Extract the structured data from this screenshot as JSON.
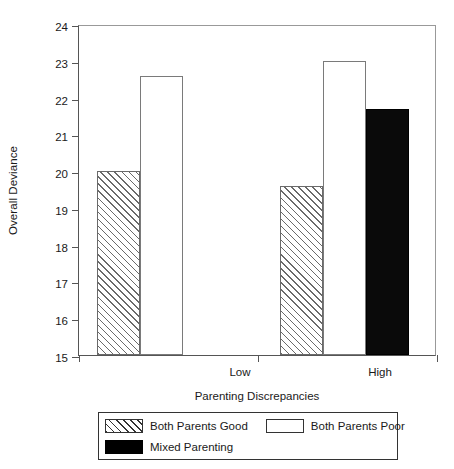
{
  "chart_data": {
    "type": "bar",
    "title": "",
    "subtitle": "",
    "xlabel": "Parenting Discrepancies",
    "ylabel": "Overall Deviance",
    "categories": [
      "Low",
      "High"
    ],
    "ylim": [
      15,
      24
    ],
    "yticks": [
      15,
      16,
      17,
      18,
      19,
      20,
      21,
      22,
      23,
      24
    ],
    "ytick_labels": [
      "15",
      "16",
      "17",
      "18",
      "19",
      "20",
      "21",
      "22",
      "23",
      "24"
    ],
    "grid": false,
    "legend_position": "bottom",
    "series": [
      {
        "name": "Both Parents Good",
        "fill": "hatch",
        "color": "#6a6a6a",
        "values": [
          20.0,
          19.6
        ]
      },
      {
        "name": "Both Parents Poor",
        "fill": "white",
        "color": "#ffffff",
        "values": [
          22.6,
          23.0
        ]
      },
      {
        "name": "Mixed Parenting",
        "fill": "black",
        "color": "#000000",
        "values": [
          null,
          21.7
        ]
      }
    ],
    "bars": [
      {
        "category": "Low",
        "series": "Both Parents Good",
        "value": 20.0,
        "fill": "hatch",
        "x": 96,
        "width": 43
      },
      {
        "category": "Low",
        "series": "Both Parents Poor",
        "value": 22.6,
        "fill": "white",
        "x": 139,
        "width": 43
      },
      {
        "category": "High",
        "series": "Both Parents Good",
        "value": 19.6,
        "fill": "hatch",
        "x": 279,
        "width": 43
      },
      {
        "category": "High",
        "series": "Both Parents Poor",
        "value": 23.0,
        "fill": "white",
        "x": 322,
        "width": 43
      },
      {
        "category": "High",
        "series": "Mixed Parenting",
        "value": 21.7,
        "fill": "black",
        "x": 365,
        "width": 43
      }
    ],
    "category_positions": [
      161,
      301
    ],
    "xtick_positions": [
      0,
      179,
      358
    ]
  },
  "legend": {
    "entries": [
      {
        "label": "Both Parents Good",
        "fill": "hatch",
        "row": 1
      },
      {
        "label": "Both Parents Poor",
        "fill": "white",
        "row": 1
      },
      {
        "label": "Mixed Parenting",
        "fill": "black",
        "row": 2
      }
    ]
  },
  "colors": {
    "axis": "#555555",
    "frame": "#999999",
    "hatch": "#6a6a6a",
    "black_bar": "#000000",
    "text": "#1a1a1a"
  }
}
